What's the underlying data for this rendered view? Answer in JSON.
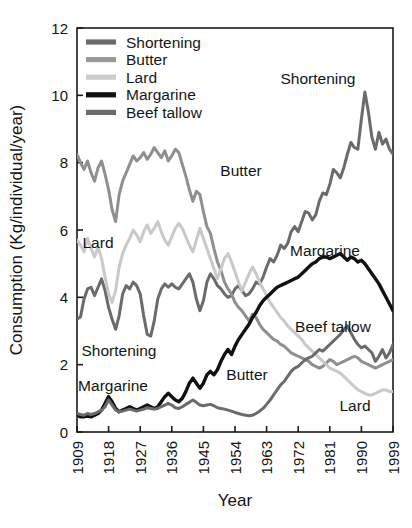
{
  "chart_data": {
    "type": "line",
    "title": "",
    "xlabel": "Year",
    "ylabel": "Consumption (Kg/individual/year)",
    "xlim": [
      1909,
      1999
    ],
    "ylim": [
      0,
      12
    ],
    "xticks": [
      "1909",
      "1918",
      "1927",
      "1936",
      "1945",
      "1954",
      "1963",
      "1972",
      "1981",
      "1990",
      "1999"
    ],
    "yticks": [
      "0",
      "2",
      "4",
      "6",
      "8",
      "10",
      "12"
    ],
    "grid": false,
    "legend_position": "top-left-inside",
    "x_start": 1909,
    "x_step": 1,
    "series": [
      {
        "name": "Shortening",
        "color": "#6b6b6b",
        "values": [
          3.35,
          3.42,
          3.95,
          4.25,
          4.3,
          4.05,
          4.3,
          4.55,
          4.2,
          3.7,
          3.35,
          3.05,
          3.45,
          4.1,
          4.35,
          4.25,
          4.45,
          4.35,
          4.1,
          3.45,
          2.9,
          2.85,
          3.3,
          3.95,
          4.25,
          4.4,
          4.3,
          4.4,
          4.3,
          4.25,
          4.4,
          4.55,
          4.7,
          4.45,
          3.95,
          3.6,
          3.9,
          4.45,
          4.7,
          4.55,
          4.35,
          4.25,
          4.1,
          4.0,
          4.05,
          4.25,
          4.35,
          4.2,
          4.05,
          4.1,
          4.25,
          4.45,
          4.4,
          4.6,
          4.9,
          5.15,
          5.05,
          5.25,
          5.55,
          5.45,
          5.6,
          5.95,
          6.1,
          5.95,
          6.25,
          6.55,
          6.5,
          6.3,
          6.45,
          6.85,
          7.1,
          7.05,
          7.35,
          7.8,
          7.7,
          7.55,
          7.85,
          8.25,
          8.6,
          8.45,
          8.4,
          9.3,
          10.1,
          9.5,
          8.75,
          8.4,
          8.9,
          8.55,
          8.7,
          8.4,
          8.25
        ],
        "label_annotation": "Shortening"
      },
      {
        "name": "Butter",
        "color": "#8f8f8f",
        "values": [
          8.25,
          8.0,
          7.8,
          8.05,
          7.7,
          7.45,
          7.85,
          8.05,
          7.65,
          7.2,
          6.6,
          6.25,
          7.05,
          7.45,
          7.7,
          7.95,
          8.2,
          8.05,
          8.15,
          8.3,
          8.1,
          8.25,
          8.45,
          8.3,
          8.15,
          8.35,
          8.05,
          8.2,
          8.4,
          8.3,
          7.95,
          7.6,
          7.2,
          6.85,
          7.15,
          7.05,
          6.55,
          6.1,
          5.9,
          5.45,
          5.05,
          4.8,
          4.45,
          4.25,
          4.1,
          3.85,
          3.7,
          3.6,
          3.45,
          3.3,
          3.5,
          3.4,
          3.2,
          3.05,
          2.95,
          2.85,
          2.75,
          2.7,
          2.6,
          2.55,
          2.45,
          2.35,
          2.3,
          2.25,
          2.2,
          2.15,
          2.1,
          2.0,
          1.95,
          1.9,
          1.95,
          2.05,
          2.15,
          2.1,
          2.0,
          2.05,
          2.1,
          2.15,
          2.2,
          2.25,
          2.2,
          2.1,
          2.05,
          2.0,
          1.95,
          1.9,
          1.95,
          2.0,
          2.05,
          2.1,
          2.15
        ],
        "label_annotation": "Butter"
      },
      {
        "name": "Lard",
        "color": "#c9c9c9",
        "values": [
          5.7,
          5.55,
          5.35,
          5.75,
          5.45,
          5.2,
          5.5,
          5.15,
          4.6,
          4.1,
          3.85,
          4.2,
          4.9,
          5.3,
          5.55,
          5.75,
          6.0,
          5.85,
          5.65,
          5.95,
          6.15,
          5.9,
          6.05,
          6.25,
          5.95,
          5.7,
          5.55,
          5.8,
          6.05,
          6.2,
          6.05,
          5.8,
          5.55,
          5.35,
          5.7,
          6.05,
          5.75,
          5.45,
          5.15,
          4.85,
          4.55,
          4.85,
          5.15,
          5.3,
          5.05,
          4.75,
          4.45,
          4.2,
          4.45,
          4.7,
          4.9,
          4.7,
          4.45,
          4.25,
          4.05,
          3.85,
          3.7,
          3.55,
          3.4,
          3.3,
          3.15,
          3.05,
          2.95,
          2.85,
          2.75,
          2.6,
          2.5,
          2.4,
          2.3,
          2.2,
          2.1,
          2.0,
          1.9,
          1.85,
          1.8,
          1.75,
          1.65,
          1.55,
          1.45,
          1.35,
          1.25,
          1.2,
          1.15,
          1.1,
          1.1,
          1.15,
          1.2,
          1.25,
          1.25,
          1.2,
          1.2
        ],
        "label_annotation": "Lard"
      },
      {
        "name": "Margarine",
        "color": "#111111",
        "values": [
          0.5,
          0.45,
          0.45,
          0.5,
          0.45,
          0.5,
          0.55,
          0.65,
          0.85,
          1.05,
          0.9,
          0.7,
          0.6,
          0.65,
          0.7,
          0.75,
          0.7,
          0.65,
          0.7,
          0.75,
          0.8,
          0.75,
          0.7,
          0.75,
          0.9,
          1.05,
          1.15,
          1.05,
          0.95,
          0.9,
          1.0,
          1.2,
          1.45,
          1.6,
          1.45,
          1.3,
          1.45,
          1.7,
          1.8,
          1.7,
          1.85,
          2.1,
          2.3,
          2.45,
          2.3,
          2.55,
          2.75,
          2.9,
          3.05,
          3.2,
          3.4,
          3.55,
          3.75,
          3.9,
          4.0,
          4.1,
          4.2,
          4.3,
          4.35,
          4.4,
          4.45,
          4.5,
          4.55,
          4.6,
          4.7,
          4.8,
          4.9,
          5.0,
          5.05,
          5.15,
          5.2,
          5.2,
          5.15,
          5.2,
          5.25,
          5.3,
          5.2,
          5.1,
          5.2,
          5.15,
          5.05,
          5.1,
          5.0,
          4.85,
          4.7,
          4.55,
          4.4,
          4.2,
          4.0,
          3.8,
          3.6
        ],
        "label_annotation": "Margarine"
      },
      {
        "name": "Beef tallow",
        "color": "#6b6b6b",
        "values": [
          0.55,
          0.52,
          0.5,
          0.55,
          0.52,
          0.55,
          0.6,
          0.65,
          0.75,
          0.95,
          0.8,
          0.65,
          0.6,
          0.62,
          0.65,
          0.68,
          0.65,
          0.62,
          0.65,
          0.68,
          0.72,
          0.7,
          0.68,
          0.7,
          0.75,
          0.8,
          0.85,
          0.8,
          0.72,
          0.7,
          0.75,
          0.82,
          0.88,
          0.95,
          0.88,
          0.8,
          0.78,
          0.8,
          0.82,
          0.78,
          0.72,
          0.7,
          0.68,
          0.65,
          0.62,
          0.58,
          0.55,
          0.52,
          0.5,
          0.48,
          0.5,
          0.55,
          0.62,
          0.7,
          0.82,
          0.95,
          1.1,
          1.25,
          1.4,
          1.5,
          1.65,
          1.8,
          1.9,
          1.95,
          2.05,
          2.15,
          2.2,
          2.25,
          2.35,
          2.45,
          2.4,
          2.5,
          2.6,
          2.7,
          2.8,
          2.9,
          3.05,
          3.15,
          2.95,
          2.75,
          2.6,
          2.5,
          2.55,
          2.45,
          2.35,
          2.1,
          2.25,
          2.45,
          2.2,
          2.35,
          2.6
        ],
        "label_annotation": "Beef tallow"
      }
    ],
    "legend_entries": [
      {
        "label": "Shortening",
        "color": "#6b6b6b"
      },
      {
        "label": "Butter",
        "color": "#9a9a9a"
      },
      {
        "label": "Lard",
        "color": "#cccccc"
      },
      {
        "label": "Margarine",
        "color": "#111111"
      },
      {
        "label": "Beef tallow",
        "color": "#6b6b6b"
      }
    ],
    "annotations": [
      {
        "text": "Shortening",
        "x": 318,
        "y": 84
      },
      {
        "text": "Butter",
        "x": 241,
        "y": 176
      },
      {
        "text": "Lard",
        "x": 98,
        "y": 248
      },
      {
        "text": "Margarine",
        "x": 325,
        "y": 256
      },
      {
        "text": "Beef tallow",
        "x": 333,
        "y": 332
      },
      {
        "text": "Shortening",
        "x": 119,
        "y": 356
      },
      {
        "text": "Butter",
        "x": 247,
        "y": 380
      },
      {
        "text": "Margarine",
        "x": 113,
        "y": 391
      },
      {
        "text": "Lard",
        "x": 355,
        "y": 411
      }
    ]
  }
}
